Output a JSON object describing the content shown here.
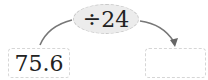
{
  "diagram": {
    "input_value": "75.6",
    "operation": "÷24",
    "output_value": "",
    "arrow_color": "#6e6e6e",
    "operation_bg": "#ececec"
  }
}
